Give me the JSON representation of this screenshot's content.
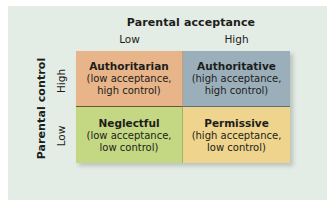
{
  "figure": {
    "background_color": "#e3ece5",
    "column_axis": {
      "title": "Parental acceptance",
      "ticks": [
        "Low",
        "High"
      ]
    },
    "row_axis": {
      "title": "Parental control",
      "ticks": [
        "High",
        "Low"
      ]
    },
    "cells": [
      {
        "id": "authoritarian",
        "title": "Authoritarian",
        "subtitle": "(low acceptance,\nhigh control)",
        "color": "#e8b489",
        "acceptance": "Low",
        "control": "High"
      },
      {
        "id": "authoritative",
        "title": "Authoritative",
        "subtitle": "(high acceptance,\nhigh control)",
        "color": "#9bafba",
        "acceptance": "High",
        "control": "High"
      },
      {
        "id": "neglectful",
        "title": "Neglectful",
        "subtitle": "(low acceptance,\nlow control)",
        "color": "#c4d782",
        "acceptance": "Low",
        "control": "Low"
      },
      {
        "id": "permissive",
        "title": "Permissive",
        "subtitle": "(high acceptance,\nlow control)",
        "color": "#eed48c",
        "acceptance": "High",
        "control": "Low"
      }
    ]
  },
  "chart_data": {
    "type": "table",
    "xlabel": "Parental acceptance",
    "ylabel": "Parental control",
    "x_categories": [
      "Low",
      "High"
    ],
    "y_categories": [
      "High",
      "Low"
    ],
    "cells": [
      [
        "Authoritarian",
        "Authoritative"
      ],
      [
        "Neglectful",
        "Permissive"
      ]
    ],
    "cell_colors": [
      [
        "#e8b489",
        "#9bafba"
      ],
      [
        "#c4d782",
        "#eed48c"
      ]
    ],
    "grid": false,
    "legend": "none"
  }
}
